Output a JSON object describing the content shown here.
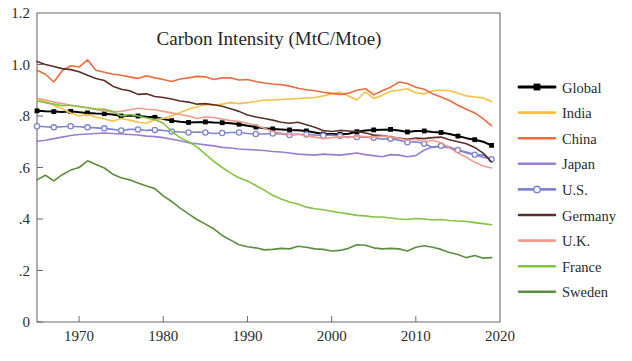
{
  "chart_data": {
    "type": "line",
    "title": "Carbon Intensity (MtC/Mtoe)",
    "xlabel": "",
    "ylabel": "",
    "xlim": [
      1965,
      2020
    ],
    "ylim": [
      0,
      1.2
    ],
    "grid": false,
    "legend_position": "right",
    "xticks": [
      "1970",
      "1980",
      "1990",
      "2000",
      "2010",
      "2020"
    ],
    "xtick_values": [
      1970,
      1980,
      1990,
      2000,
      2010,
      2020
    ],
    "yticks": [
      "0",
      ".2",
      ".4",
      ".6",
      ".8",
      "1.0",
      "1.2"
    ],
    "ytick_values": [
      0,
      0.2,
      0.4,
      0.6,
      0.8,
      1.0,
      1.2
    ],
    "x": [
      1965,
      1966,
      1967,
      1968,
      1969,
      1970,
      1971,
      1972,
      1973,
      1974,
      1975,
      1976,
      1977,
      1978,
      1979,
      1980,
      1981,
      1982,
      1983,
      1984,
      1985,
      1986,
      1987,
      1988,
      1989,
      1990,
      1991,
      1992,
      1993,
      1994,
      1995,
      1996,
      1997,
      1998,
      1999,
      2000,
      2001,
      2002,
      2003,
      2004,
      2005,
      2006,
      2007,
      2008,
      2009,
      2010,
      2011,
      2012,
      2013,
      2014,
      2015,
      2016,
      2017,
      2018,
      2019
    ],
    "series": [
      {
        "name": "Global",
        "color": "#000000",
        "marker": "square",
        "values": [
          0.82,
          0.818,
          0.817,
          0.816,
          0.818,
          0.815,
          0.812,
          0.81,
          0.809,
          0.806,
          0.8,
          0.802,
          0.8,
          0.797,
          0.795,
          0.788,
          0.782,
          0.778,
          0.775,
          0.776,
          0.777,
          0.775,
          0.774,
          0.772,
          0.768,
          0.762,
          0.757,
          0.752,
          0.75,
          0.748,
          0.746,
          0.745,
          0.742,
          0.736,
          0.73,
          0.73,
          0.729,
          0.731,
          0.739,
          0.744,
          0.746,
          0.747,
          0.748,
          0.744,
          0.738,
          0.742,
          0.742,
          0.738,
          0.736,
          0.73,
          0.722,
          0.714,
          0.708,
          0.7,
          0.686
        ]
      },
      {
        "name": "India",
        "color": "#f7c143",
        "marker": "none",
        "values": [
          0.862,
          0.856,
          0.842,
          0.828,
          0.812,
          0.8,
          0.806,
          0.796,
          0.788,
          0.78,
          0.79,
          0.784,
          0.776,
          0.772,
          0.786,
          0.79,
          0.8,
          0.814,
          0.826,
          0.836,
          0.844,
          0.842,
          0.846,
          0.852,
          0.848,
          0.852,
          0.856,
          0.862,
          0.862,
          0.864,
          0.866,
          0.868,
          0.87,
          0.872,
          0.878,
          0.886,
          0.892,
          0.878,
          0.862,
          0.894,
          0.868,
          0.88,
          0.896,
          0.9,
          0.906,
          0.89,
          0.886,
          0.898,
          0.9,
          0.898,
          0.888,
          0.878,
          0.874,
          0.87,
          0.856
        ]
      },
      {
        "name": "China",
        "color": "#ec6b3f",
        "marker": "none",
        "values": [
          0.978,
          0.962,
          0.932,
          0.976,
          0.995,
          0.99,
          1.018,
          0.978,
          0.97,
          0.962,
          0.958,
          0.952,
          0.946,
          0.956,
          0.948,
          0.942,
          0.934,
          0.944,
          0.948,
          0.954,
          0.952,
          0.942,
          0.948,
          0.948,
          0.94,
          0.942,
          0.934,
          0.928,
          0.924,
          0.922,
          0.916,
          0.908,
          0.902,
          0.898,
          0.892,
          0.888,
          0.884,
          0.888,
          0.9,
          0.906,
          0.882,
          0.898,
          0.912,
          0.932,
          0.926,
          0.912,
          0.904,
          0.886,
          0.874,
          0.86,
          0.842,
          0.826,
          0.812,
          0.79,
          0.762
        ]
      },
      {
        "name": "Japan",
        "color": "#9b7ed1",
        "marker": "none",
        "values": [
          0.702,
          0.706,
          0.712,
          0.718,
          0.724,
          0.728,
          0.73,
          0.732,
          0.734,
          0.732,
          0.73,
          0.728,
          0.726,
          0.722,
          0.72,
          0.716,
          0.71,
          0.704,
          0.696,
          0.692,
          0.688,
          0.684,
          0.678,
          0.676,
          0.672,
          0.67,
          0.668,
          0.666,
          0.662,
          0.66,
          0.656,
          0.652,
          0.65,
          0.648,
          0.652,
          0.65,
          0.648,
          0.652,
          0.656,
          0.65,
          0.646,
          0.642,
          0.65,
          0.648,
          0.642,
          0.646,
          0.668,
          0.68,
          0.682,
          0.676,
          0.668,
          0.66,
          0.65,
          0.64,
          0.632
        ]
      },
      {
        "name": "U.S.",
        "color": "#7d85cf",
        "marker": "circle",
        "values": [
          0.76,
          0.758,
          0.756,
          0.758,
          0.76,
          0.758,
          0.756,
          0.754,
          0.752,
          0.748,
          0.744,
          0.748,
          0.748,
          0.744,
          0.746,
          0.744,
          0.74,
          0.738,
          0.736,
          0.738,
          0.736,
          0.732,
          0.734,
          0.736,
          0.736,
          0.732,
          0.73,
          0.73,
          0.732,
          0.73,
          0.726,
          0.728,
          0.728,
          0.726,
          0.724,
          0.726,
          0.722,
          0.718,
          0.718,
          0.718,
          0.716,
          0.71,
          0.712,
          0.706,
          0.698,
          0.7,
          0.692,
          0.678,
          0.684,
          0.68,
          0.668,
          0.656,
          0.65,
          0.648,
          0.632
        ]
      },
      {
        "name": "Germany",
        "color": "#5a3028",
        "marker": "none",
        "values": [
          1.012,
          1.0,
          0.992,
          0.984,
          0.98,
          0.972,
          0.958,
          0.946,
          0.938,
          0.916,
          0.904,
          0.898,
          0.884,
          0.886,
          0.876,
          0.872,
          0.866,
          0.858,
          0.854,
          0.846,
          0.848,
          0.844,
          0.838,
          0.828,
          0.818,
          0.804,
          0.796,
          0.79,
          0.784,
          0.776,
          0.772,
          0.776,
          0.766,
          0.756,
          0.744,
          0.74,
          0.744,
          0.742,
          0.74,
          0.734,
          0.726,
          0.724,
          0.718,
          0.714,
          0.71,
          0.714,
          0.712,
          0.716,
          0.718,
          0.708,
          0.7,
          0.692,
          0.678,
          0.656,
          0.622
        ]
      },
      {
        "name": "U.K.",
        "color": "#f09c8c",
        "marker": "none",
        "values": [
          0.868,
          0.862,
          0.854,
          0.848,
          0.842,
          0.838,
          0.832,
          0.824,
          0.82,
          0.816,
          0.818,
          0.824,
          0.83,
          0.826,
          0.824,
          0.818,
          0.812,
          0.806,
          0.8,
          0.79,
          0.796,
          0.794,
          0.788,
          0.782,
          0.778,
          0.772,
          0.764,
          0.752,
          0.74,
          0.734,
          0.728,
          0.73,
          0.722,
          0.718,
          0.712,
          0.716,
          0.72,
          0.716,
          0.722,
          0.72,
          0.718,
          0.722,
          0.718,
          0.714,
          0.706,
          0.71,
          0.7,
          0.706,
          0.696,
          0.676,
          0.656,
          0.64,
          0.62,
          0.606,
          0.598
        ]
      },
      {
        "name": "France",
        "color": "#82c341",
        "marker": "none",
        "values": [
          0.858,
          0.852,
          0.846,
          0.84,
          0.842,
          0.836,
          0.832,
          0.828,
          0.826,
          0.818,
          0.8,
          0.806,
          0.8,
          0.792,
          0.786,
          0.772,
          0.74,
          0.716,
          0.7,
          0.68,
          0.652,
          0.624,
          0.6,
          0.578,
          0.56,
          0.548,
          0.53,
          0.512,
          0.492,
          0.478,
          0.466,
          0.458,
          0.446,
          0.44,
          0.436,
          0.43,
          0.424,
          0.42,
          0.414,
          0.412,
          0.408,
          0.408,
          0.404,
          0.4,
          0.398,
          0.402,
          0.4,
          0.396,
          0.398,
          0.394,
          0.392,
          0.39,
          0.386,
          0.382,
          0.378
        ]
      },
      {
        "name": "Sweden",
        "color": "#5b8e3e",
        "marker": "none",
        "values": [
          0.552,
          0.57,
          0.548,
          0.572,
          0.59,
          0.6,
          0.626,
          0.612,
          0.598,
          0.574,
          0.56,
          0.552,
          0.54,
          0.528,
          0.518,
          0.49,
          0.468,
          0.442,
          0.42,
          0.398,
          0.38,
          0.362,
          0.336,
          0.318,
          0.3,
          0.292,
          0.288,
          0.28,
          0.282,
          0.286,
          0.284,
          0.294,
          0.29,
          0.284,
          0.282,
          0.276,
          0.278,
          0.286,
          0.3,
          0.298,
          0.288,
          0.284,
          0.286,
          0.284,
          0.276,
          0.29,
          0.296,
          0.29,
          0.282,
          0.27,
          0.262,
          0.25,
          0.258,
          0.248,
          0.25
        ]
      }
    ]
  },
  "legend": {
    "items": [
      {
        "label": "Global"
      },
      {
        "label": "India"
      },
      {
        "label": "China"
      },
      {
        "label": "Japan"
      },
      {
        "label": "U.S."
      },
      {
        "label": "Germany"
      },
      {
        "label": "U.K."
      },
      {
        "label": "France"
      },
      {
        "label": "Sweden"
      }
    ]
  }
}
